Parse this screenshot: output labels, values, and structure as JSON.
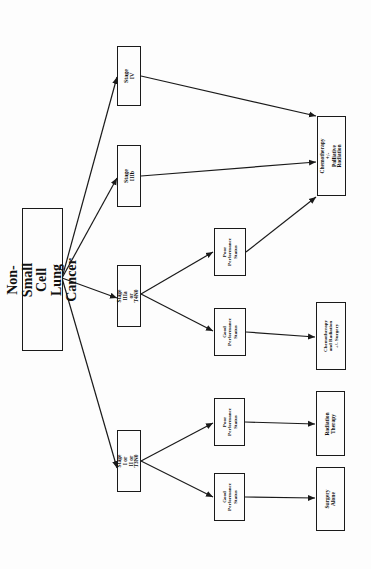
{
  "diagram": {
    "title": "Non-Small Cell Lung Cancer",
    "orientation": "rotated-90-ccw (reads bottom-to-top, flows left-to-right)",
    "colors": {
      "line": "#1a1a1a",
      "background": "#fdfdfd",
      "text": "#111111"
    },
    "nodes": {
      "root": {
        "label": "Non-Small Cell\nLung Cancer"
      },
      "stage4": {
        "label": "Stage IV"
      },
      "stage3b": {
        "label": "Stage IIIb"
      },
      "stage3a": {
        "label": "Stage IIIa or\nT4N0"
      },
      "stage12": {
        "label": "Stage I or II or\nT3N0"
      },
      "poor_3a": {
        "label": "Poor\nPerformance\nStatus"
      },
      "good_3a": {
        "label": "Good\nPerformance\nStatus"
      },
      "poor_12": {
        "label": "Poor\nPerformance\nStatus"
      },
      "good_12": {
        "label": "Good\nPerformance\nStatus"
      },
      "chemo_pall": {
        "label": "Chemotherapy +/-\nPalliative Radiation"
      },
      "chemo_rad": {
        "label": "Chemotherapy\nand Radiation\n+/- Surgery"
      },
      "radiation": {
        "label": "Radiation Therapy"
      },
      "surgery": {
        "label": "Surgery Alone"
      }
    },
    "edges": [
      {
        "from": "root",
        "to": "stage4"
      },
      {
        "from": "root",
        "to": "stage3b"
      },
      {
        "from": "root",
        "to": "stage3a"
      },
      {
        "from": "root",
        "to": "stage12"
      },
      {
        "from": "stage4",
        "to": "chemo_pall"
      },
      {
        "from": "stage3b",
        "to": "chemo_pall"
      },
      {
        "from": "stage3a",
        "to": "poor_3a"
      },
      {
        "from": "stage3a",
        "to": "good_3a"
      },
      {
        "from": "poor_3a",
        "to": "chemo_pall"
      },
      {
        "from": "good_3a",
        "to": "chemo_rad"
      },
      {
        "from": "stage12",
        "to": "poor_12"
      },
      {
        "from": "stage12",
        "to": "good_12"
      },
      {
        "from": "poor_12",
        "to": "radiation"
      },
      {
        "from": "good_12",
        "to": "surgery"
      }
    ]
  }
}
